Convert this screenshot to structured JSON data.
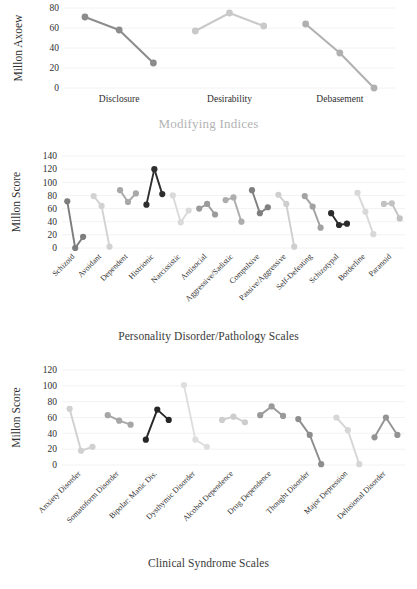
{
  "figure": {
    "name": "millon-clinical-multiaxial-profile",
    "background": "#ffffff"
  },
  "chart_data": [
    {
      "id": "modifying-indices",
      "type": "line",
      "title": "",
      "xlabel": "Modifying Indices",
      "ylabel": "Millon Axoew",
      "ylim": [
        0,
        80
      ],
      "yticks": [
        0,
        20,
        40,
        60,
        80
      ],
      "grid": true,
      "legend": "none",
      "categories": [
        "Disclosure",
        "Desirability",
        "Debasement"
      ],
      "groups": [
        {
          "category": "Disclosure",
          "color": "#8c8c8c",
          "values": [
            71,
            58,
            25
          ]
        },
        {
          "category": "Desirability",
          "color": "#c9c9c9",
          "values": [
            57,
            75,
            62
          ]
        },
        {
          "category": "Debasement",
          "color": "#b0b0b0",
          "values": [
            64,
            35,
            0
          ]
        }
      ]
    },
    {
      "id": "personality-disorder-pathology-scales",
      "type": "line",
      "title": "",
      "xlabel": "Personality Disorder/Pathology Scales",
      "ylabel": "Millon Score",
      "ylim": [
        0,
        140
      ],
      "yticks": [
        0,
        20,
        40,
        60,
        80,
        100,
        120,
        140
      ],
      "grid": true,
      "legend": "none",
      "categories": [
        "Schizoid",
        "Avoidant",
        "Dependent",
        "Histrionic",
        "Narcissistic",
        "Antisocial",
        "Aggressive/Sadistic",
        "Compulsive",
        "Passive/Aggressive",
        "Self-Defeating",
        "Schizotypal",
        "Borderline",
        "Paranoid"
      ],
      "groups": [
        {
          "category": "Schizoid",
          "color": "#7d7d7d",
          "values": [
            71,
            0,
            17
          ]
        },
        {
          "category": "Avoidant",
          "color": "#d2d2d2",
          "values": [
            79,
            64,
            2
          ]
        },
        {
          "category": "Dependent",
          "color": "#a8a8a8",
          "values": [
            88,
            70,
            83
          ]
        },
        {
          "category": "Histrionic",
          "color": "#2e2e2e",
          "values": [
            66,
            120,
            82
          ]
        },
        {
          "category": "Narcissistic",
          "color": "#dadada",
          "values": [
            80,
            39,
            57
          ]
        },
        {
          "category": "Antisocial",
          "color": "#9b9b9b",
          "values": [
            60,
            67,
            51
          ]
        },
        {
          "category": "Aggressive/Sadistic",
          "color": "#adadad",
          "values": [
            73,
            77,
            40
          ]
        },
        {
          "category": "Compulsive",
          "color": "#7f7f7f",
          "values": [
            88,
            53,
            62
          ]
        },
        {
          "category": "Passive/Aggressive",
          "color": "#cfcfcf",
          "values": [
            81,
            67,
            2
          ]
        },
        {
          "category": "Self-Defeating",
          "color": "#a2a2a2",
          "values": [
            79,
            63,
            31
          ]
        },
        {
          "category": "Schizotypal",
          "color": "#2b2b2b",
          "values": [
            53,
            35,
            37
          ]
        },
        {
          "category": "Borderline",
          "color": "#d8d8d8",
          "values": [
            84,
            55,
            21
          ]
        },
        {
          "category": "Paranoid",
          "color": "#c2c2c2",
          "values": [
            67,
            68,
            45
          ]
        }
      ]
    },
    {
      "id": "clinical-syndrome-scales",
      "type": "line",
      "title": "",
      "xlabel": "Clinical Syndrome Scales",
      "ylabel": "Millon Score",
      "ylim": [
        0,
        120
      ],
      "yticks": [
        0,
        20,
        40,
        60,
        80,
        100,
        120
      ],
      "grid": true,
      "legend": "none",
      "categories": [
        "Anxiety Disorder",
        "Somatoform Disorder",
        "Bipolar: Manic Dis.",
        "Dysthymic Disorder",
        "Alcohol Dependence",
        "Drug Dependence",
        "Thought Disorder",
        "Major Depression",
        "Delusional Disorder"
      ],
      "groups": [
        {
          "category": "Anxiety Disorder",
          "color": "#d0d0d0",
          "values": [
            71,
            18,
            23
          ]
        },
        {
          "category": "Somatoform Disorder",
          "color": "#a6a6a6",
          "values": [
            63,
            56,
            51
          ]
        },
        {
          "category": "Bipolar: Manic Dis.",
          "color": "#262626",
          "values": [
            32,
            70,
            57
          ]
        },
        {
          "category": "Dysthymic Disorder",
          "color": "#dedede",
          "values": [
            101,
            32,
            23
          ]
        },
        {
          "category": "Alcohol Dependence",
          "color": "#cdcdcd",
          "values": [
            57,
            61,
            54
          ]
        },
        {
          "category": "Drug Dependence",
          "color": "#9a9a9a",
          "values": [
            63,
            74,
            62
          ]
        },
        {
          "category": "Thought Disorder",
          "color": "#8e8e8e",
          "values": [
            58,
            38,
            1
          ]
        },
        {
          "category": "Major Depression",
          "color": "#d6d6d6",
          "values": [
            60,
            44,
            1
          ]
        },
        {
          "category": "Delusional Disorder",
          "color": "#949494",
          "values": [
            35,
            60,
            38
          ]
        }
      ]
    }
  ]
}
